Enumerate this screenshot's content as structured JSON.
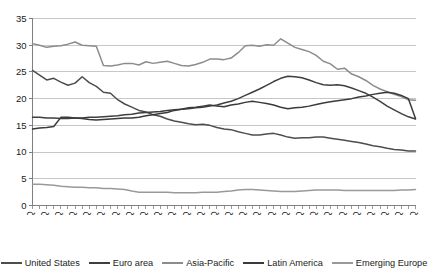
{
  "chart_data": {
    "type": "line",
    "title": "",
    "subtitle": "",
    "xlabel": "",
    "ylabel": "",
    "ylim": [
      0,
      35
    ],
    "yticks": [
      0,
      5,
      10,
      15,
      20,
      25,
      30,
      35
    ],
    "grid": true,
    "legend_position": "bottom",
    "x": [
      "2000-1-Q",
      "2000-2-Q",
      "2000-3-Q",
      "2000-4-Q",
      "2001-1-Q",
      "2001-2-Q",
      "2001-3-Q",
      "2001-4-Q",
      "2002-1-Q",
      "2002-2-Q",
      "2002-3-Q",
      "2002-4-Q",
      "2003-1-Q",
      "2003-2-Q",
      "2003-3-Q",
      "2003-4-Q",
      "2004-1-Q",
      "2004-2-Q",
      "2004-3-Q",
      "2004-4-Q",
      "2005-1-Q",
      "2005-2-Q",
      "2005-3-Q",
      "2005-4-Q",
      "2006-1-Q",
      "2006-2-Q",
      "2006-3-Q",
      "2006-4-Q",
      "2007-1-Q",
      "2007-2-Q",
      "2007-3-Q",
      "2007-4-Q",
      "2008-1-Q",
      "2008-2-Q",
      "2008-3-Q",
      "2008-4-Q",
      "2009-1-Q",
      "2009-2-Q",
      "2009-3-Q",
      "2009-4-Q",
      "2010-1-Q",
      "2010-2-Q",
      "2010-3-Q",
      "2010-4-Q",
      "2011-1-Q",
      "2011-2-Q",
      "2011-3-Q",
      "2011-4-Q",
      "2012-1-Q",
      "2012-2-Q",
      "2012-3-Q",
      "2012-4-Q",
      "2013-1-Q",
      "2013-2-Q",
      "2013-3-Q"
    ],
    "xtick_labels": [
      "2000-1-Q",
      "2000-3-Q",
      "2001-1-Q",
      "2001-3-Q",
      "2002-1-Q",
      "2002-3-Q",
      "2003-1-Q",
      "2003-3-Q",
      "2004-1-Q",
      "2004-3-Q",
      "2005-1-Q",
      "2005-3-Q",
      "2006-1-Q",
      "2006-3-Q",
      "2007-1-Q",
      "2007-3-Q",
      "2008-1-Q",
      "2008-3-Q",
      "2009-1-Q",
      "2009-3-Q",
      "2010-1-Q",
      "2010-3-Q",
      "2011-1-Q",
      "2011-3-Q",
      "2012-1-Q",
      "2012-3-Q",
      "2013-1-Q",
      "2013-3-Q"
    ],
    "series": [
      {
        "name": "United States",
        "color": "#4d4d4d",
        "values": [
          25.3,
          24.4,
          23.5,
          23.8,
          23.1,
          22.5,
          22.9,
          24.1,
          23.0,
          22.3,
          21.2,
          21.0,
          19.8,
          19.0,
          18.4,
          17.8,
          17.5,
          17.0,
          16.7,
          16.2,
          15.8,
          15.6,
          15.3,
          15.1,
          15.2,
          15.0,
          14.6,
          14.3,
          14.2,
          13.8,
          13.5,
          13.2,
          13.2,
          13.4,
          13.5,
          13.2,
          12.8,
          12.6,
          12.7,
          12.7,
          12.8,
          12.8,
          12.6,
          12.4,
          12.2,
          12.0,
          11.8,
          11.5,
          11.2,
          11.0,
          10.7,
          10.5,
          10.4,
          10.2,
          10.2
        ]
      },
      {
        "name": "Euro area",
        "color": "#3f3f3f",
        "values": [
          16.5,
          16.5,
          16.4,
          16.4,
          16.3,
          16.3,
          16.4,
          16.4,
          16.5,
          16.5,
          16.6,
          16.7,
          16.8,
          17.0,
          17.1,
          17.3,
          17.4,
          17.5,
          17.6,
          17.8,
          17.9,
          18.0,
          18.1,
          18.3,
          18.4,
          18.6,
          18.8,
          19.2,
          19.5,
          20.0,
          20.6,
          21.2,
          21.8,
          22.5,
          23.2,
          23.8,
          24.2,
          24.1,
          23.9,
          23.5,
          23.0,
          22.6,
          22.5,
          22.6,
          22.4,
          22.0,
          21.5,
          21.0,
          20.3,
          19.5,
          18.6,
          17.9,
          17.2,
          16.6,
          16.2
        ]
      },
      {
        "name": "Asia-Pacific",
        "color": "#8c8c8c",
        "values": [
          30.3,
          30.0,
          29.6,
          29.8,
          29.9,
          30.2,
          30.6,
          30.0,
          29.9,
          29.8,
          26.2,
          26.1,
          26.3,
          26.6,
          26.6,
          26.3,
          26.9,
          26.6,
          26.8,
          27.0,
          26.6,
          26.2,
          26.1,
          26.4,
          26.8,
          27.4,
          27.4,
          27.3,
          27.6,
          28.6,
          29.9,
          30.0,
          29.8,
          30.1,
          30.0,
          31.2,
          30.4,
          29.6,
          29.2,
          28.8,
          28.1,
          27.0,
          26.5,
          25.5,
          25.7,
          24.6,
          24.1,
          23.4,
          22.5,
          21.8,
          21.3,
          20.8,
          20.4,
          19.8,
          19.7
        ]
      },
      {
        "name": "Latin America",
        "color": "#3a3a3a",
        "values": [
          14.3,
          14.5,
          14.6,
          14.8,
          16.5,
          16.5,
          16.4,
          16.3,
          16.1,
          16.0,
          16.1,
          16.2,
          16.3,
          16.4,
          16.4,
          16.5,
          16.8,
          17.0,
          17.2,
          17.4,
          17.8,
          18.0,
          18.3,
          18.4,
          18.6,
          18.8,
          18.6,
          18.5,
          18.8,
          19.0,
          19.3,
          19.5,
          19.3,
          19.1,
          18.8,
          18.4,
          18.1,
          18.3,
          18.4,
          18.6,
          18.9,
          19.2,
          19.4,
          19.6,
          19.8,
          20.0,
          20.3,
          20.5,
          20.8,
          21.0,
          21.2,
          21.0,
          20.6,
          20.0,
          16.3
        ]
      },
      {
        "name": "Emerging Europe",
        "color": "#999999",
        "values": [
          4.0,
          4.0,
          3.9,
          3.8,
          3.6,
          3.5,
          3.4,
          3.4,
          3.3,
          3.3,
          3.2,
          3.2,
          3.1,
          3.0,
          2.7,
          2.5,
          2.5,
          2.5,
          2.5,
          2.5,
          2.4,
          2.4,
          2.4,
          2.4,
          2.5,
          2.5,
          2.5,
          2.6,
          2.7,
          2.9,
          3.0,
          3.0,
          2.9,
          2.8,
          2.7,
          2.6,
          2.6,
          2.6,
          2.7,
          2.8,
          2.9,
          2.9,
          2.9,
          2.9,
          2.8,
          2.8,
          2.8,
          2.8,
          2.8,
          2.8,
          2.8,
          2.8,
          2.9,
          2.9,
          3.0
        ]
      }
    ]
  },
  "legend": {
    "items": [
      {
        "label": "United States"
      },
      {
        "label": "Euro area"
      },
      {
        "label": "Asia-Pacific"
      },
      {
        "label": "Latin America"
      },
      {
        "label": "Emerging Europe"
      }
    ]
  }
}
